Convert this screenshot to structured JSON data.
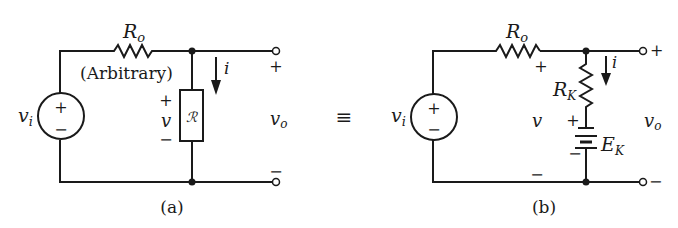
{
  "figure": {
    "equivalence_symbol": "≡",
    "panel_a": {
      "caption": "(a)",
      "source_label": "v",
      "source_label_sub": "i",
      "source_plus": "+",
      "source_minus": "−",
      "series_resistor_label": "R",
      "series_resistor_sub": "o",
      "series_resistor_note": "(Arbitrary)",
      "element_label": "ℛ",
      "element_voltage_label": "v",
      "element_voltage_plus": "+",
      "element_voltage_minus": "−",
      "current_label": "i",
      "output_label": "v",
      "output_label_sub": "o",
      "output_plus": "+",
      "output_minus": "−"
    },
    "panel_b": {
      "caption": "(b)",
      "source_label": "v",
      "source_label_sub": "i",
      "source_plus": "+",
      "source_minus": "−",
      "series_resistor_label": "R",
      "series_resistor_sub": "o",
      "node_voltage_label": "v",
      "node_voltage_plus": "+",
      "node_voltage_minus": "−",
      "thevenin_resistor_label": "R",
      "thevenin_resistor_sub": "K",
      "battery_label": "E",
      "battery_sub": "K",
      "battery_plus": "+",
      "battery_minus": "−",
      "current_label": "i",
      "output_label": "v",
      "output_label_sub": "o",
      "output_plus": "+",
      "output_minus": "−"
    }
  }
}
